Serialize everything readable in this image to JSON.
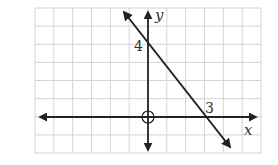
{
  "chart_data": {
    "type": "line",
    "title": "",
    "xlabel": "x",
    "ylabel": "y",
    "xlim": [
      -6,
      6
    ],
    "ylim": [
      -2,
      6
    ],
    "grid": true,
    "annotations": [
      {
        "text": "4",
        "at": [
          0,
          4
        ],
        "meaning": "y-intercept"
      },
      {
        "text": "3",
        "at": [
          3,
          0
        ],
        "meaning": "x-intercept"
      }
    ],
    "series": [
      {
        "name": "line",
        "points": [
          [
            0,
            4
          ],
          [
            3,
            0
          ]
        ],
        "equation": "y = -4/3 x + 4",
        "extends": "both directions (arrows)"
      }
    ],
    "origin_marker": "circle"
  },
  "labels": {
    "x_axis": "x",
    "y_axis": "y",
    "y_intercept": "4",
    "x_intercept": "3"
  },
  "colors": {
    "grid": "#d4d4d4",
    "axes": "#222222",
    "line": "#222222",
    "background": "#ffffff"
  }
}
